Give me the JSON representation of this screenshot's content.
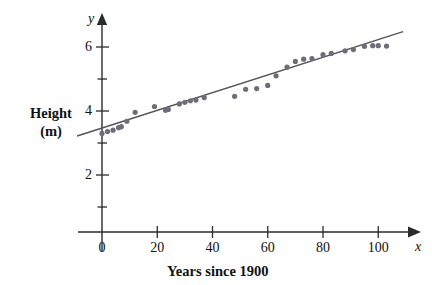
{
  "figure": {
    "axis_var_x": "x",
    "axis_var_y": "y",
    "y_axis_label_line1": "Height",
    "y_axis_label_line2": "(m)",
    "x_caption": "Years since 1900"
  },
  "colors": {
    "axis": "#2b2b2b",
    "point": "#6e6e78",
    "trend": "#555555",
    "background": "#ffffff",
    "text": "#111111"
  },
  "ticks": {
    "x_labeled": [
      "0",
      "20",
      "40",
      "60",
      "80",
      "100"
    ],
    "y_labeled": [
      "2",
      "4",
      "6"
    ],
    "x_minor_values": [
      20,
      40,
      60,
      80,
      100
    ],
    "y_minor_values": [
      1,
      2,
      3,
      4,
      5,
      6
    ]
  },
  "chart_data": {
    "type": "scatter",
    "title": "",
    "subtitle": "",
    "xlabel": "Years since 1900",
    "ylabel": "Height (m)",
    "xlim": [
      -8,
      112
    ],
    "ylim": [
      0,
      6.9
    ],
    "grid": false,
    "legend": null,
    "x_tick_labels": [
      "0",
      "20",
      "40",
      "60",
      "80",
      "100"
    ],
    "x_tick_values": [
      0,
      20,
      40,
      60,
      80,
      100
    ],
    "y_tick_labels": [
      "2",
      "4",
      "6"
    ],
    "y_tick_values": [
      2,
      4,
      6
    ],
    "series": [
      {
        "name": "Pole vault record height",
        "type": "scatter",
        "marker": "filled-circle",
        "color": "#6e6e78",
        "points": [
          [
            0,
            3.3
          ],
          [
            2,
            3.36
          ],
          [
            4,
            3.4
          ],
          [
            6,
            3.48
          ],
          [
            7,
            3.51
          ],
          [
            9,
            3.68
          ],
          [
            12,
            3.96
          ],
          [
            19,
            4.14
          ],
          [
            23,
            4.02
          ],
          [
            24,
            4.05
          ],
          [
            28,
            4.22
          ],
          [
            30,
            4.27
          ],
          [
            32,
            4.32
          ],
          [
            34,
            4.34
          ],
          [
            37,
            4.42
          ],
          [
            48,
            4.46
          ],
          [
            52,
            4.68
          ],
          [
            56,
            4.7
          ],
          [
            60,
            4.8
          ],
          [
            63,
            5.1
          ],
          [
            67,
            5.37
          ],
          [
            70,
            5.55
          ],
          [
            73,
            5.62
          ],
          [
            76,
            5.64
          ],
          [
            80,
            5.76
          ],
          [
            83,
            5.8
          ],
          [
            88,
            5.88
          ],
          [
            91,
            5.92
          ],
          [
            95,
            6.02
          ],
          [
            98,
            6.04
          ],
          [
            100,
            6.04
          ],
          [
            103,
            6.03
          ]
        ]
      },
      {
        "name": "Least squares regression line",
        "type": "line",
        "color": "#555555",
        "endpoints": [
          [
            -9,
            3.22
          ],
          [
            109,
            6.48
          ]
        ]
      }
    ]
  }
}
